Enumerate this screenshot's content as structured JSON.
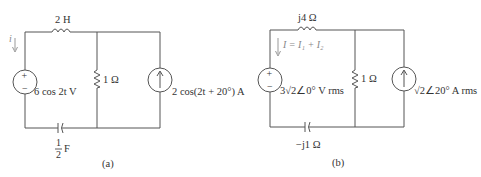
{
  "circuits": [
    {
      "id": "a",
      "caption": "(a)",
      "inductor_label": "2 H",
      "resistor_label": "1 Ω",
      "voltage_source_label": "6 cos 2t V",
      "current_source_label": "2 cos(2t + 20°) A",
      "capacitor_label_num": "1",
      "capacitor_label_den": "2",
      "capacitor_label_unit": "F",
      "current_label": "i",
      "plus": "+",
      "minus": "−"
    },
    {
      "id": "b",
      "caption": "(b)",
      "inductor_label": "j4 Ω",
      "resistor_label": "1 Ω",
      "voltage_source_label": "3√2∠0° V rms",
      "current_source_label": "√2∠20° A rms",
      "capacitor_label": "−j1 Ω",
      "current_label": "I = I₁ + I₂",
      "plus": "+",
      "minus": "−"
    }
  ],
  "colors": {
    "wire": "#555555",
    "text": "#333333",
    "annotation": "#888888"
  }
}
